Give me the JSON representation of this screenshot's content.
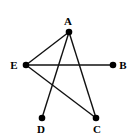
{
  "graph": {
    "nodes": [
      {
        "id": "A",
        "label": "A",
        "x": 69,
        "y": 32,
        "lx": 68,
        "ly": 25
      },
      {
        "id": "B",
        "label": "B",
        "x": 113,
        "y": 65,
        "lx": 123,
        "ly": 69
      },
      {
        "id": "C",
        "label": "C",
        "x": 96,
        "y": 118,
        "lx": 97,
        "ly": 133
      },
      {
        "id": "D",
        "label": "D",
        "x": 42,
        "y": 118,
        "lx": 41,
        "ly": 133
      },
      {
        "id": "E",
        "label": "E",
        "x": 26,
        "y": 65,
        "lx": 14,
        "ly": 69
      }
    ],
    "edges": [
      {
        "from": "A",
        "to": "E"
      },
      {
        "from": "A",
        "to": "D"
      },
      {
        "from": "A",
        "to": "C"
      },
      {
        "from": "E",
        "to": "B"
      },
      {
        "from": "E",
        "to": "C"
      }
    ],
    "colors": {
      "node": "#000000",
      "edge": "#111111",
      "background": "#ffffff"
    }
  }
}
